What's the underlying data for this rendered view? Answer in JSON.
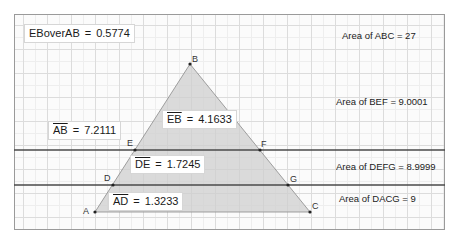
{
  "diagram": {
    "type": "geometry",
    "points": {
      "A": {
        "label": "A",
        "x": 95,
        "y": 212
      },
      "D": {
        "label": "D",
        "x": 113,
        "y": 185
      },
      "E": {
        "label": "E",
        "x": 135,
        "y": 150
      },
      "B": {
        "label": "B",
        "x": 190,
        "y": 64
      },
      "F": {
        "label": "F",
        "x": 260,
        "y": 150
      },
      "G": {
        "label": "G",
        "x": 288,
        "y": 185
      },
      "C": {
        "label": "C",
        "x": 310,
        "y": 212
      }
    },
    "triangle": [
      "A",
      "B",
      "C"
    ],
    "parallel_lines": [
      {
        "name": "line-EF",
        "y": 150
      },
      {
        "name": "line-DG",
        "y": 185
      }
    ],
    "colors": {
      "fill": "#cfcfcf",
      "line": "#4a4a4a",
      "edge": "#8a8a8a",
      "point": "#222222"
    }
  },
  "measurements": {
    "ratio": {
      "name": "EBoverAB",
      "eq": "=",
      "value": "0.5774"
    },
    "AB": {
      "segment": "AB",
      "eq": "=",
      "value": "7.2111"
    },
    "EB": {
      "segment": "EB",
      "eq": "=",
      "value": "4.1633"
    },
    "DE": {
      "segment": "DE",
      "eq": "=",
      "value": "1.7245"
    },
    "AD": {
      "segment": "AD",
      "eq": "=",
      "value": "1.3233"
    }
  },
  "areas": {
    "ABC": "Area of  ABC = 27",
    "BEF": "Area of  BEF = 9.0001",
    "DEFG": "Area of  DEFG = 8.9999",
    "DACG": "Area of  DACG = 9"
  }
}
